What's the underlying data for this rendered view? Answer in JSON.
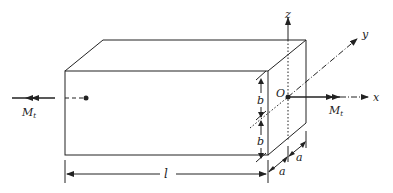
{
  "diagram": {
    "type": "rectangular bar under torsion",
    "labels": {
      "torque_left": "M",
      "torque_left_sub": "t",
      "torque_right": "M",
      "torque_right_sub": "t",
      "origin": "O",
      "axis_x": "x",
      "axis_y": "y",
      "axis_z": "z",
      "half_height_top": "b",
      "half_height_bottom": "b",
      "half_width_front": "a",
      "half_width_back": "a",
      "length": "l"
    },
    "colors": {
      "stroke": "#222222",
      "background": "#ffffff"
    }
  }
}
